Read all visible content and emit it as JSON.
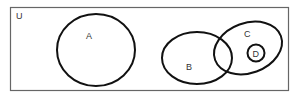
{
  "diagram": {
    "type": "venn",
    "universe": {
      "label": "U"
    },
    "sets": [
      {
        "id": "A",
        "label": "A"
      },
      {
        "id": "B",
        "label": "B"
      },
      {
        "id": "C",
        "label": "C"
      },
      {
        "id": "D",
        "label": "D"
      }
    ],
    "relations": [
      "A is disjoint from B, C, D",
      "B and C overlap",
      "D is a subset of C",
      "D is disjoint from B"
    ],
    "colors": {
      "stroke": "#111111",
      "frame": "#666666",
      "background": "#ffffff"
    }
  }
}
